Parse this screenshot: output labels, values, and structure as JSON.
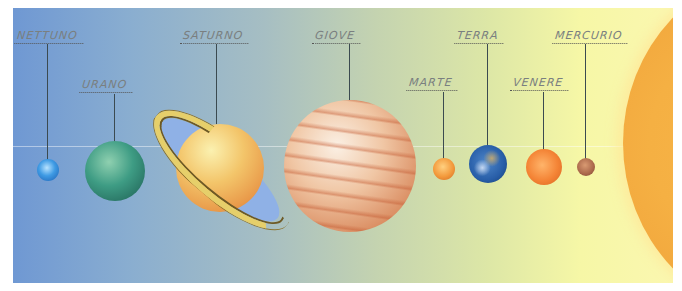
{
  "diagram": {
    "ecliptic_y": 146,
    "planets": [
      {
        "id": "neptune",
        "label": "NETTUNO",
        "x": 48,
        "y": 170,
        "r": 11,
        "color": "#3f9be4"
      },
      {
        "id": "uranus",
        "label": "URANO",
        "x": 115,
        "y": 171,
        "r": 30,
        "color": "#3e9c84"
      },
      {
        "id": "saturn",
        "label": "SATURNO",
        "x": 220,
        "y": 168,
        "r": 44,
        "color": "#f3c56a"
      },
      {
        "id": "jupiter",
        "label": "GIOVE",
        "x": 350,
        "y": 166,
        "r": 66,
        "color": "#e8a881"
      },
      {
        "id": "mars",
        "label": "MARTE",
        "x": 444,
        "y": 169,
        "r": 11,
        "color": "#f39a3c"
      },
      {
        "id": "earth",
        "label": "TERRA",
        "x": 488,
        "y": 164,
        "r": 19,
        "color": "#285ea8"
      },
      {
        "id": "venus",
        "label": "VENERE",
        "x": 544,
        "y": 167,
        "r": 18,
        "color": "#f48436"
      },
      {
        "id": "mercury",
        "label": "MERCURIO",
        "x": 586,
        "y": 167,
        "r": 9,
        "color": "#a9674a"
      }
    ],
    "sun": {
      "label": "",
      "color": "#f5b043"
    }
  }
}
